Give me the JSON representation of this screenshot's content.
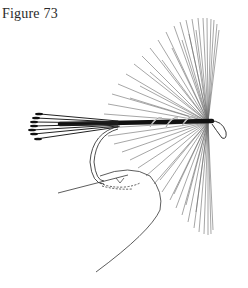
{
  "figure": {
    "caption": "Figure 73"
  },
  "colors": {
    "background": "#ffffff",
    "ink": "#1a1a1a",
    "hackle": "#6a6a6a",
    "body": "#111111"
  }
}
